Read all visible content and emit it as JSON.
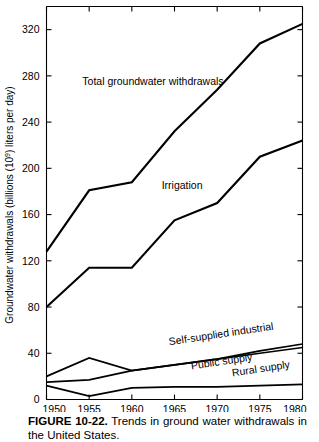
{
  "figure": {
    "caption_label": "FIGURE 10-22.",
    "caption_text": "Trends in ground water withdrawals in the United States."
  },
  "chart_data": {
    "type": "line",
    "title": "",
    "xlabel": "",
    "ylabel": "Groundwater withdrawals (billions (10⁹) liters per day)",
    "x": [
      1950,
      1955,
      1960,
      1965,
      1970,
      1975,
      1980
    ],
    "xticklabels": [
      "1950",
      "1955",
      "1960",
      "1965",
      "1970",
      "1975",
      "1980"
    ],
    "xlim": [
      1950,
      1980
    ],
    "ylim": [
      0,
      340
    ],
    "yticks": [
      0,
      40,
      80,
      120,
      160,
      200,
      240,
      280,
      320
    ],
    "yticklabels": [
      "0",
      "40",
      "80",
      "120",
      "160",
      "200",
      "240",
      "280",
      "320"
    ],
    "grid": false,
    "legend": "inline-annotations",
    "series": [
      {
        "name": "Total groundwater withdrawals",
        "label": "Total groundwater withdrawals",
        "values": [
          128,
          181,
          188,
          232,
          268,
          308,
          325
        ],
        "color": "#000000"
      },
      {
        "name": "Irrigation",
        "label": "Irrigation",
        "values": [
          80,
          114,
          114,
          155,
          170,
          210,
          224
        ],
        "color": "#000000"
      },
      {
        "name": "Self-supplied industrial",
        "label": "Self-supplied industrial",
        "values": [
          20,
          36,
          25,
          30,
          35,
          42,
          48
        ],
        "color": "#000000"
      },
      {
        "name": "Public supply",
        "label": "Public supply",
        "values": [
          15,
          17,
          25,
          30,
          35,
          40,
          45
        ],
        "color": "#000000"
      },
      {
        "name": "Rural supply",
        "label": "Rural supply",
        "values": [
          12,
          3,
          10,
          11,
          11,
          12,
          13
        ],
        "color": "#000000"
      }
    ],
    "annotations": [
      {
        "text": "Total groundwater withdrawals",
        "x": 1954.2,
        "y": 272,
        "rotation": 0
      },
      {
        "text": "Irrigation",
        "x": 1963.5,
        "y": 182,
        "rotation": 0
      },
      {
        "text": "Self-supplied industrial",
        "x": 1964.4,
        "y": 47,
        "rotation": -8.5
      },
      {
        "text": "Public supply",
        "x": 1967.0,
        "y": 26,
        "rotation": -8.5
      },
      {
        "text": "Rural supply",
        "x": 1971.8,
        "y": 20,
        "rotation": -8.5
      }
    ]
  }
}
